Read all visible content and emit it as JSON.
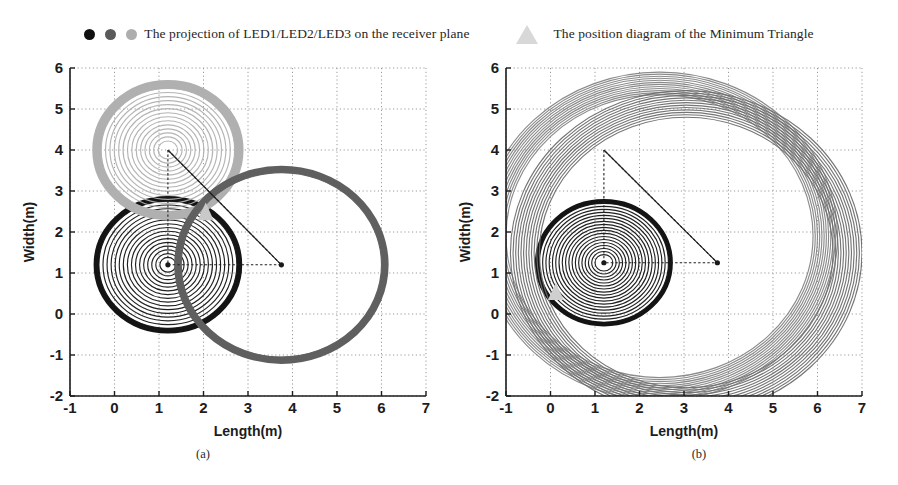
{
  "legend": {
    "series_entry": {
      "icon_black": "led1-dot-icon",
      "icon_darkgray": "led2-dot-icon",
      "icon_lightgray": "led3-dot-icon",
      "label": "The projection of LED1/LED2/LED3 on the  receiver plane",
      "colors": [
        "#111111",
        "#5a5a5a",
        "#aeaeae"
      ]
    },
    "triangle_entry": {
      "icon": "minimum-triangle-marker-icon",
      "label": "The position diagram of the Minimum Triangle",
      "color": "#d8d8d8"
    }
  },
  "chart_data": [
    {
      "id": "a",
      "type": "scatter",
      "caption": "(a)",
      "title": "",
      "xlabel": "Length(m)",
      "ylabel": "Width(m)",
      "xlim": [
        -1,
        7
      ],
      "ylim": [
        -2,
        6
      ],
      "xticks": [
        "-1",
        "0",
        "1",
        "2",
        "3",
        "4",
        "5",
        "6",
        "7"
      ],
      "yticks": [
        "-2",
        "-1",
        "0",
        "1",
        "2",
        "3",
        "4",
        "5",
        "6"
      ],
      "grid": true,
      "legend_position": "above-figure",
      "series": [
        {
          "name": "LED1 projection",
          "color": "#141414",
          "center": [
            1.2,
            1.2
          ],
          "rings": 16,
          "r_min": 0.18,
          "r_max": 1.55,
          "outer_band": 0.12
        },
        {
          "name": "LED3 projection",
          "color": "#b0b0b0",
          "center": [
            1.2,
            4.0
          ],
          "rings": 14,
          "r_min": 0.22,
          "r_max": 1.5,
          "outer_band": 0.2
        },
        {
          "name": "LED2 projection",
          "color": "#5f5f5f",
          "center": [
            3.75,
            1.2
          ],
          "rings": 1,
          "r_min": 2.25,
          "r_max": 2.25,
          "outer_band": 0.16
        }
      ],
      "triangle": {
        "name": "Minimum Triangle",
        "vertices": [
          [
            1.2,
            4.0
          ],
          [
            1.2,
            1.2
          ],
          [
            3.75,
            1.2
          ]
        ],
        "vertex_marker_color": "#1a1a1a",
        "marker_color": "#c9c9c9",
        "marker_position": [
          2.05,
          2.45
        ]
      }
    },
    {
      "id": "b",
      "type": "scatter",
      "caption": "(b)",
      "title": "",
      "xlabel": "Length(m)",
      "ylabel": "Width(m)",
      "xlim": [
        -1,
        7
      ],
      "ylim": [
        -2,
        6
      ],
      "xticks": [
        "-1",
        "0",
        "1",
        "2",
        "3",
        "4",
        "5",
        "6",
        "7"
      ],
      "yticks": [
        "-2",
        "-1",
        "0",
        "1",
        "2",
        "3",
        "4",
        "5",
        "6"
      ],
      "grid": true,
      "legend_position": "above-figure",
      "series": [
        {
          "name": "LED1 projection",
          "color": "#141414",
          "center": [
            1.2,
            1.25
          ],
          "rings": 18,
          "r_min": 0.2,
          "r_max": 1.45,
          "outer_band": 0.1
        },
        {
          "name": "LED3 projection",
          "color": "#858585",
          "center": [
            2.45,
            1.9
          ],
          "rings": 12,
          "r_min": 3.45,
          "r_max": 4.0,
          "outer_band": 0.0
        },
        {
          "name": "LED2 projection",
          "color": "#6e6e6e",
          "center": [
            3.05,
            1.5
          ],
          "rings": 12,
          "r_min": 3.3,
          "r_max": 3.95,
          "outer_band": 0.0
        }
      ],
      "triangle": {
        "name": "Minimum Triangle",
        "vertices": [
          [
            1.2,
            4.0
          ],
          [
            1.2,
            1.25
          ],
          [
            3.75,
            1.25
          ]
        ],
        "vertex_marker_color": "#1a1a1a",
        "marker_color": "#cfcfcf",
        "marker_position": [
          0.12,
          0.5
        ]
      }
    }
  ]
}
